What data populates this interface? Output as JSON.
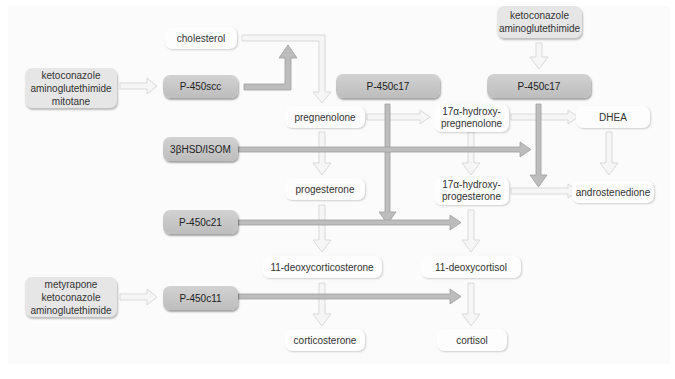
{
  "diagram": {
    "substrates": {
      "cholesterol": "cholesterol",
      "pregnenolone": "pregnenolone",
      "hydroxy_pregnenolone_1": "17α-hydroxy-",
      "hydroxy_pregnenolone_2": "pregnenolone",
      "dhea": "DHEA",
      "progesterone": "progesterone",
      "hydroxy_progesterone_1": "17α-hydroxy-",
      "hydroxy_progesterone_2": "progesterone",
      "androstenedione": "androstenedione",
      "deoxycorticosterone": "11-deoxycorticosterone",
      "deoxycortisol": "11-deoxycortisol",
      "corticosterone": "corticosterone",
      "cortisol": "cortisol"
    },
    "enzymes": {
      "p450scc": "P-450scc",
      "p450c17_a": "P-450c17",
      "p450c17_b": "P-450c17",
      "hsd": "3βHSD/ISOM",
      "p450c21": "P-450c21",
      "p450c11": "P-450c11"
    },
    "inhibitors": {
      "scc_group": [
        "ketoconazole",
        "aminoglutethimide",
        "mitotane"
      ],
      "c17_group": [
        "ketoconazole",
        "aminoglutethimide"
      ],
      "c11_group": [
        "metyrapone",
        "ketoconazole",
        "aminoglutethimide"
      ]
    },
    "colors": {
      "enzyme_fill": "#c8c8c8",
      "inhibitor_fill": "#e6e6e6",
      "substrate_fill": "#fdfdfd",
      "enzyme_arrow": "#b8b8b8",
      "pathway_arrow": "#e4e4e4"
    }
  }
}
